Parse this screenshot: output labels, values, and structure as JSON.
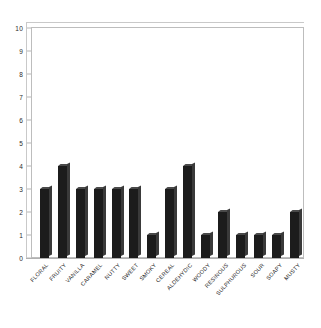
{
  "chart_data": {
    "type": "bar",
    "title": "",
    "subtitle": "",
    "xlabel": "",
    "ylabel": "",
    "ylim": [
      0,
      10
    ],
    "ytick_step": 1,
    "yticks": [
      "10",
      "9",
      "8",
      "7",
      "6",
      "5",
      "4",
      "3",
      "2",
      "1",
      "0"
    ],
    "grid": false,
    "legend": false,
    "legend_position": "none",
    "bar_style": "3d-column",
    "categories": [
      "FLORAL",
      "FRUITY",
      "VANILLA",
      "CARAMEL",
      "NUTTY",
      "SWEET",
      "SMOKY",
      "CEREAL",
      "ALDEHYDIC",
      "WOODY",
      "RESINOUS",
      "SULPHUROUS",
      "SOUR",
      "SOAPY",
      "MUSTY"
    ],
    "values": [
      3,
      4,
      3,
      3,
      3,
      3,
      1,
      3,
      4,
      1,
      2,
      1,
      1,
      1,
      2
    ],
    "xtick_rotation": -47
  },
  "colors": {
    "bar_face": "#1c1c1c",
    "bar_side": "#3a3a3a",
    "bar_top": "#4a4a4a",
    "plot_background": "#ffffff",
    "page_background": "#ffffff",
    "frame_line": "#bdbdbd",
    "frame_back_line": "#c9c9c9",
    "axis_text": "#2b2b2b"
  }
}
